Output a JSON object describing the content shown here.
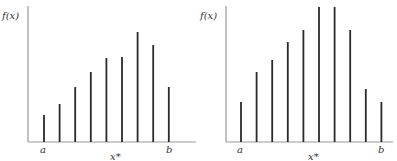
{
  "chart_data": [
    {
      "type": "bar",
      "title": "",
      "ylabel": "f(x)",
      "xlabel": "",
      "x_annotations": {
        "left": "a",
        "right": "b",
        "peak": "x*"
      },
      "grid": false,
      "values": [
        27,
        38,
        55,
        70,
        84,
        85,
        110,
        97,
        55
      ],
      "categories": [
        "1",
        "2",
        "3",
        "4",
        "5",
        "6",
        "7",
        "8",
        "9"
      ],
      "ylim": [
        0,
        132
      ]
    },
    {
      "type": "bar",
      "title": "",
      "ylabel": "f(x)",
      "xlabel": "",
      "x_annotations": {
        "left": "a",
        "right": "b",
        "peak": "x*"
      },
      "grid": false,
      "values": [
        40,
        70,
        82,
        100,
        112,
        135,
        135,
        112,
        53,
        40
      ],
      "categories": [
        "1",
        "2",
        "3",
        "4",
        "5",
        "6",
        "7",
        "8",
        "9",
        "10"
      ],
      "ylim": [
        0,
        135
      ]
    }
  ],
  "labels": {
    "left": {
      "ylabel": "f(x)",
      "a": "a",
      "b": "b",
      "xstar": "x*"
    },
    "right": {
      "ylabel": "f(x)",
      "a": "a",
      "b": "b",
      "xstar": "x*"
    }
  },
  "colors": {
    "bar": "#2a2a2a",
    "axis": "#9a9a9a"
  }
}
